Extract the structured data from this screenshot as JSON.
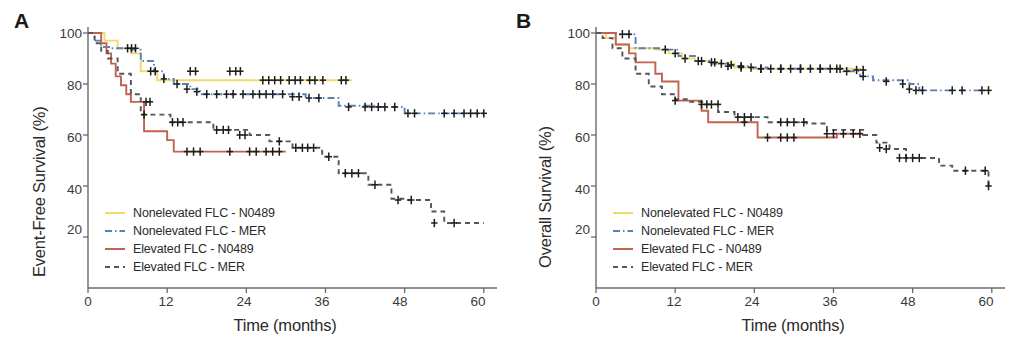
{
  "figure": {
    "panels": [
      {
        "letter": "A",
        "ylabel": "Event-Free Survival (%)",
        "xlabel": "Time (months)"
      },
      {
        "letter": "B",
        "ylabel": "Overall Survival (%)",
        "xlabel": "Time (months)"
      }
    ]
  },
  "legend": {
    "items": [
      {
        "label": "Nonelevated FLC - N0489",
        "color": "#f2d96b",
        "style": "solid"
      },
      {
        "label": "Nonelevated FLC - MER",
        "color": "#5b7fb8",
        "style": "dashdot"
      },
      {
        "label": "Elevated FLC - N0489",
        "color": "#c2624f",
        "style": "solid"
      },
      {
        "label": "Elevated FLC - MER",
        "color": "#55565a",
        "style": "dashed"
      }
    ]
  },
  "chart_data": [
    {
      "type": "line",
      "title": "A",
      "subtitle": "Event-Free Survival by FLC status",
      "xlabel": "Time (months)",
      "ylabel": "Event-Free Survival (%)",
      "xlim": [
        0,
        62
      ],
      "ylim": [
        0,
        103
      ],
      "xticks": [
        0,
        12,
        24,
        36,
        48,
        60
      ],
      "yticks": [
        20,
        40,
        60,
        80,
        100
      ],
      "grid": false,
      "legend_position": "lower-left",
      "curve_shape": "step",
      "censor_marker": "plus",
      "series": [
        {
          "name": "Nonelevated FLC - N0489",
          "color": "#f2d96b",
          "style": "solid",
          "x": [
            0,
            1.5,
            2.5,
            4.5,
            5.5,
            6.5,
            8.0,
            9.0,
            10.5,
            40.0
          ],
          "y": [
            100,
            100,
            97,
            94,
            94,
            92,
            85,
            85,
            81.5,
            81.5
          ],
          "censor_x": [
            6.0,
            6.6,
            7.2,
            9.5,
            10.2,
            15.5,
            16.3,
            21.5,
            22.4,
            23.1,
            26.5,
            27.4,
            28.3,
            29.2,
            30.5,
            31.4,
            32.2,
            33.6,
            34.4,
            35.6,
            38.4,
            39.1
          ],
          "censor_y": [
            94,
            94,
            94,
            85,
            85,
            85,
            85,
            85,
            85,
            85,
            81.5,
            81.5,
            81.5,
            81.5,
            81.5,
            81.5,
            81.5,
            81.5,
            81.5,
            81.5,
            81.5,
            81.5
          ]
        },
        {
          "name": "Nonelevated FLC - MER",
          "color": "#5b7fb8",
          "style": "dashdot",
          "x": [
            0,
            1.0,
            2.0,
            3.5,
            5.5,
            6.5,
            8.0,
            10.0,
            11.5,
            13.0,
            15.5,
            17.0,
            19.0,
            24.0,
            29.0,
            33.0,
            36.5,
            38.0,
            43.5,
            48.0,
            60.0
          ],
          "y": [
            100,
            97,
            94.5,
            94,
            94,
            93.5,
            89,
            85,
            82,
            80,
            78,
            76,
            76,
            76,
            76,
            74.5,
            74.5,
            71.5,
            71,
            68.5,
            68.5
          ],
          "censor_x": [
            11.5,
            13.5,
            15.0,
            16.5,
            18.0,
            19.5,
            21.0,
            22.0,
            23.5,
            25.0,
            26.0,
            27.0,
            28.0,
            29.5,
            31.0,
            32.0,
            33.5,
            35.0,
            39.5,
            42.0,
            43.0,
            44.0,
            45.0,
            46.5,
            48.5,
            49.5,
            54.0,
            55.5,
            57.0,
            58.0,
            59.0,
            60.0
          ],
          "censor_y": [
            82,
            80,
            78,
            77,
            76,
            76,
            76,
            76,
            76,
            76,
            76,
            76,
            76,
            76,
            75,
            75,
            74.5,
            74.5,
            71,
            71,
            71,
            71,
            71,
            71,
            68.5,
            68.5,
            68.5,
            68.5,
            68.5,
            68.5,
            68.5,
            68.5
          ]
        },
        {
          "name": "Elevated FLC - N0489",
          "color": "#c2624f",
          "style": "solid",
          "x": [
            0,
            1.2,
            2.0,
            2.8,
            3.5,
            4.2,
            5.0,
            5.8,
            6.5,
            8.5,
            11.0,
            12.0,
            13.0,
            30.0
          ],
          "y": [
            100,
            100,
            96,
            92,
            88,
            83,
            79.5,
            76,
            73,
            61.5,
            61.5,
            58,
            53.5,
            53.5
          ],
          "censor_x": [
            8.8,
            9.4,
            15.0,
            16.0,
            17.0,
            21.5,
            24.5,
            25.5,
            27.0,
            28.0,
            29.0
          ],
          "censor_y": [
            73,
            73,
            53.5,
            53.5,
            53.5,
            53.5,
            53.5,
            53.5,
            53.5,
            53.5,
            53.5
          ]
        },
        {
          "name": "Elevated FLC - MER",
          "color": "#55565a",
          "style": "dashed",
          "x": [
            0,
            1.0,
            2.0,
            3.0,
            4.5,
            6.5,
            8.0,
            10.0,
            12.5,
            15.5,
            19.0,
            22.0,
            24.5,
            27.5,
            29.5,
            31.0,
            33.0,
            35.5,
            38.0,
            40.0,
            42.5,
            44.5,
            46.0,
            48.0,
            50.0,
            52.0,
            54.0,
            56.0,
            58.0,
            60.0
          ],
          "y": [
            100,
            96,
            93,
            90,
            84,
            76,
            68,
            68,
            65,
            65,
            62,
            62,
            60,
            57.5,
            57.5,
            55,
            55,
            51.5,
            45,
            45,
            40.5,
            40.5,
            35,
            34.5,
            34.5,
            30,
            25.5,
            25.5,
            25.5,
            25.5
          ],
          "censor_x": [
            8.5,
            12.8,
            13.6,
            14.4,
            19.5,
            20.5,
            21.3,
            23.0,
            23.8,
            29.0,
            31.5,
            32.5,
            33.3,
            34.2,
            36.5,
            39.0,
            40.0,
            41.0,
            43.5,
            47.0,
            49.0,
            52.5,
            55.5
          ],
          "censor_y": [
            68,
            65,
            65,
            65,
            62,
            62,
            62,
            60,
            60,
            57.5,
            55,
            55,
            55,
            55,
            51.5,
            45,
            45,
            45,
            40.5,
            34.5,
            34.5,
            25.5,
            25.5
          ]
        }
      ]
    },
    {
      "type": "line",
      "title": "B",
      "subtitle": "Overall Survival by FLC status",
      "xlabel": "Time (months)",
      "ylabel": "Overall Survival (%)",
      "xlim": [
        0,
        62
      ],
      "ylim": [
        0,
        103
      ],
      "xticks": [
        0,
        12,
        24,
        36,
        48,
        60
      ],
      "yticks": [
        20,
        40,
        60,
        80,
        100
      ],
      "grid": false,
      "legend_position": "lower-left",
      "curve_shape": "step",
      "censor_marker": "plus",
      "series": [
        {
          "name": "Nonelevated FLC - N0489",
          "color": "#f2d96b",
          "style": "solid",
          "x": [
            0,
            1.5,
            3.0,
            5.0,
            7.0,
            9.0,
            11.0,
            13.0,
            15.0,
            17.0,
            19.0,
            21.0,
            23.5,
            26.0,
            36.0,
            38.5,
            40.0,
            41.0
          ],
          "y": [
            100,
            98,
            95.5,
            94,
            94,
            93.5,
            92,
            90,
            89,
            88.5,
            88,
            86.5,
            86,
            86,
            86,
            86,
            85.5,
            85.5
          ],
          "censor_x": [
            13.5,
            15.5,
            17.5,
            20.0,
            22.0,
            25.0,
            28.0,
            31.0,
            34.0,
            37.0,
            39.5,
            40.5
          ],
          "censor_y": [
            90,
            89,
            88.5,
            87,
            86.5,
            86,
            86,
            86,
            86,
            86,
            85.5,
            85.5
          ]
        },
        {
          "name": "Nonelevated FLC - MER",
          "color": "#5b7fb8",
          "style": "dashdot",
          "x": [
            0,
            1.0,
            3.0,
            4.5,
            6.0,
            8.0,
            10.0,
            12.5,
            15.0,
            17.5,
            20.0,
            23.0,
            26.0,
            30.0,
            34.0,
            37.5,
            40.0,
            42.0,
            45.0,
            47.5,
            49.0,
            53.0,
            56.0,
            59.5
          ],
          "y": [
            100,
            100,
            99.5,
            99.5,
            94,
            94,
            93.5,
            91,
            89,
            88,
            87,
            86.5,
            86,
            86,
            86,
            85,
            83,
            81.5,
            81.5,
            80,
            77.5,
            77.5,
            77.5,
            77.5
          ],
          "censor_x": [
            4.0,
            5.0,
            10.5,
            12.0,
            16.0,
            18.0,
            19.0,
            20.5,
            22.0,
            23.5,
            25.0,
            26.5,
            28.0,
            29.5,
            31.0,
            32.5,
            34.0,
            35.5,
            36.5,
            38.0,
            40.5,
            44.0,
            46.5,
            47.5,
            48.5,
            49.5,
            54.0,
            55.5,
            58.5,
            59.5
          ],
          "censor_y": [
            99.5,
            99.5,
            93.5,
            92,
            89,
            88.5,
            88,
            87.5,
            87,
            86.5,
            86,
            86,
            86,
            86,
            86,
            86,
            86,
            86,
            86,
            85,
            83,
            81,
            80,
            78,
            77.5,
            77.5,
            77.5,
            77.5,
            77.5,
            77.5
          ]
        },
        {
          "name": "Elevated FLC - N0489",
          "color": "#c2624f",
          "style": "solid",
          "x": [
            0,
            1.5,
            3.0,
            4.0,
            5.0,
            6.0,
            7.5,
            9.0,
            10.0,
            11.0,
            12.5,
            14.5,
            16.0,
            17.0,
            19.0,
            23.8,
            24.5,
            34.0,
            36.5,
            40.5
          ],
          "y": [
            100,
            100,
            95.5,
            95.5,
            92,
            88.5,
            88.5,
            84,
            81,
            81,
            73.5,
            73.5,
            69.5,
            65,
            65,
            65,
            59,
            59,
            60.5,
            60.5
          ],
          "censor_x": [
            12.0,
            17.5,
            18.5,
            22.5,
            26.0,
            28.0,
            29.0,
            30.0,
            35.0,
            36.0,
            37.5,
            39.0,
            40.0
          ],
          "censor_y": [
            73.5,
            72,
            72,
            65,
            59,
            59,
            59,
            59,
            60.5,
            60.5,
            60.5,
            60.5,
            60.5
          ]
        },
        {
          "name": "Elevated FLC - MER",
          "color": "#55565a",
          "style": "dashed",
          "x": [
            0,
            1.0,
            2.5,
            4.0,
            6.0,
            8.0,
            10.0,
            12.0,
            14.0,
            16.5,
            18.5,
            21.0,
            23.5,
            26.0,
            29.0,
            32.0,
            35.0,
            38.0,
            40.5,
            42.5,
            44.5,
            47.0,
            49.5,
            52.0,
            54.0,
            56.5,
            58.5,
            59.5
          ],
          "y": [
            100,
            98,
            94,
            90,
            84,
            79,
            76,
            74,
            73,
            72,
            69,
            67,
            67,
            65,
            65,
            64.5,
            62,
            62,
            60,
            57,
            54.5,
            51,
            51,
            48,
            46,
            46,
            46,
            40
          ],
          "censor_x": [
            16.0,
            16.8,
            21.5,
            22.5,
            23.5,
            28.0,
            29.0,
            30.0,
            31.5,
            43.0,
            44.0,
            46.0,
            47.0,
            48.0,
            49.0,
            56.0,
            59.0,
            59.5
          ],
          "censor_y": [
            72,
            72,
            67,
            67,
            67,
            65,
            65,
            65,
            65,
            55,
            54.5,
            51,
            51,
            51,
            51,
            46,
            46,
            40
          ]
        }
      ]
    }
  ]
}
